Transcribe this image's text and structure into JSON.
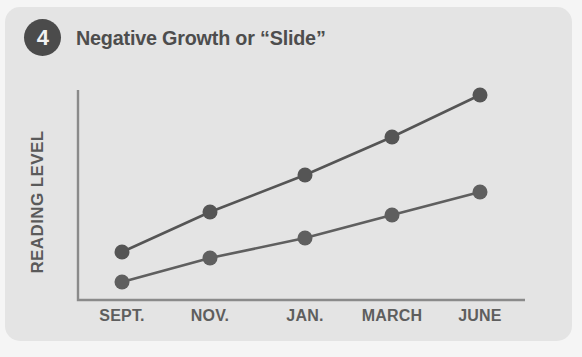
{
  "card": {
    "background": "#e4e4e4",
    "page_background": "#f5f5f5"
  },
  "header": {
    "badge_number": "4",
    "badge_color": "#4b4b4b",
    "title": "Negative Growth or “Slide”",
    "title_color": "#4d4d4d"
  },
  "chart_data": {
    "type": "line",
    "title": "Negative Growth or “Slide”",
    "xlabel": "",
    "ylabel": "READING LEVEL",
    "categories": [
      "SEPT.",
      "NOV.",
      "JAN.",
      "MARCH",
      "JUNE"
    ],
    "grid": false,
    "legend": "none",
    "axis_color": "#8a8a8a",
    "marker_color": "#5a5a5a",
    "line_color": "#5a5a5a",
    "ylim": [
      0,
      100
    ],
    "xlim": [
      0,
      4
    ],
    "series": [
      {
        "name": "Expected Growth",
        "values": [
          26,
          45,
          63,
          81,
          101
        ],
        "color": "#555555"
      },
      {
        "name": "Slide",
        "values": [
          12,
          23,
          33,
          44,
          55
        ],
        "color": "#5f5f5f"
      }
    ],
    "pixel_geometry": {
      "axis_x": 78,
      "axis_y": 300,
      "axis_top": 90,
      "axis_right": 525,
      "tick_x": [
        122,
        210,
        305,
        392,
        480
      ],
      "series_y": [
        [
          252,
          212,
          175,
          137,
          95
        ],
        [
          282,
          258,
          238,
          215,
          192
        ]
      ],
      "marker_radius": 7.5,
      "line_width": 2.6
    }
  }
}
